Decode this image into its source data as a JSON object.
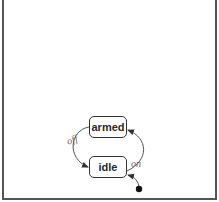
{
  "diagram": {
    "type": "state-machine",
    "states": [
      {
        "id": "armed",
        "label": "armed"
      },
      {
        "id": "idle",
        "label": "idle"
      }
    ],
    "initial_state": "idle",
    "transitions": [
      {
        "from": "armed",
        "to": "idle",
        "label": "off"
      },
      {
        "from": "idle",
        "to": "armed",
        "label": "on"
      }
    ]
  },
  "colors": {
    "stroke": "#333333",
    "frame": "#555555",
    "label": "#666666",
    "background": "#ffffff"
  }
}
